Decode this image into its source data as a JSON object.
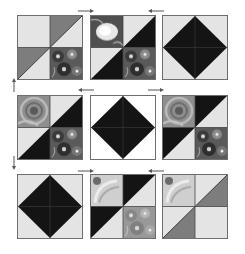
{
  "colors": {
    "light": "#e4e4e4",
    "white": "#ffffff",
    "medium": "#7d7d7d",
    "dark": "#141414",
    "border": "#6e6e6e",
    "print_dark": "#4a4a4a",
    "print_light": "#b8b8b8",
    "arrow": "#555555"
  },
  "grid": {
    "rows": 3,
    "cols": 3,
    "blocks": [
      {
        "row": 1,
        "col": 1,
        "design": "half-square-triangles",
        "tone": "medium",
        "print_quadrant": "bottom-right"
      },
      {
        "row": 1,
        "col": 2,
        "design": "half-square-triangles",
        "tone": "dark",
        "print_quadrants": [
          "top-left",
          "bottom-right"
        ]
      },
      {
        "row": 1,
        "col": 3,
        "design": "diamond",
        "tone": "dark",
        "background": "light"
      },
      {
        "row": 2,
        "col": 1,
        "design": "half-square-triangles",
        "tone": "dark",
        "print_quadrants": [
          "top-left",
          "bottom-right"
        ]
      },
      {
        "row": 2,
        "col": 2,
        "design": "diamond",
        "tone": "dark",
        "background": "white"
      },
      {
        "row": 2,
        "col": 3,
        "design": "half-square-triangles",
        "tone": "dark",
        "print_quadrants": [
          "top-left",
          "bottom-right"
        ]
      },
      {
        "row": 3,
        "col": 1,
        "design": "diamond",
        "tone": "dark",
        "background": "light"
      },
      {
        "row": 3,
        "col": 2,
        "design": "half-square-triangles",
        "tone": "dark",
        "print_quadrants": [
          "top-left",
          "bottom-right"
        ]
      },
      {
        "row": 3,
        "col": 3,
        "design": "half-square-triangles",
        "tone": "medium",
        "print_quadrant": "top-left"
      }
    ]
  },
  "arrows": [
    {
      "position": "row1-between-1-2",
      "direction": "right"
    },
    {
      "position": "row1-between-2-3",
      "direction": "left"
    },
    {
      "position": "left-between-row1-2",
      "direction": "up"
    },
    {
      "position": "row2-between-1-2",
      "direction": "left"
    },
    {
      "position": "row2-between-2-3",
      "direction": "right"
    },
    {
      "position": "left-between-row2-3",
      "direction": "down"
    },
    {
      "position": "row3-between-1-2",
      "direction": "right"
    },
    {
      "position": "row3-between-2-3",
      "direction": "left"
    }
  ]
}
